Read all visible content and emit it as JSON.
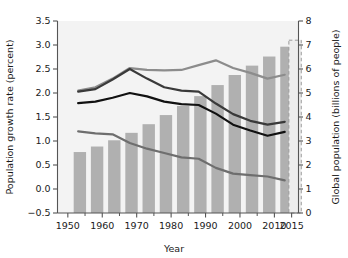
{
  "chart_data": {
    "type": "bar",
    "title": "",
    "xlabel": "Year",
    "ylabel": "Population growth rate (percent)",
    "y2label": "Global population (billions of people)",
    "xlim": [
      1947,
      2017
    ],
    "ylim": [
      -0.5,
      3.5
    ],
    "y2lim": [
      0,
      8
    ],
    "grid": false,
    "legend": "none",
    "xticks": [
      1950,
      1960,
      1970,
      1980,
      1990,
      2000,
      2010,
      2015
    ],
    "xtick_labels": [
      "1950",
      "1960",
      "1970",
      "1980",
      "1990",
      "2000",
      "2010",
      "2015"
    ],
    "xminor_ticks": [
      1955,
      1965,
      1975,
      1985,
      1995,
      2005
    ],
    "yticks": [
      -0.5,
      0.0,
      0.5,
      1.0,
      1.5,
      2.0,
      2.5,
      3.0,
      3.5
    ],
    "ytick_labels": [
      "−0.5",
      "0.0",
      "0.5",
      "1.0",
      "1.5",
      "2.0",
      "2.5",
      "3.0",
      "3.5"
    ],
    "y2ticks": [
      0,
      1,
      2,
      3,
      4,
      5,
      6,
      7,
      8
    ],
    "y2tick_labels": [
      "0",
      "1",
      "2",
      "3",
      "4",
      "5",
      "6",
      "7",
      "8"
    ],
    "bars": {
      "name": "Global population",
      "axis": "right",
      "unit": "billions of people",
      "color": "#b0b0b0",
      "categories": [
        1950,
        1955,
        1960,
        1965,
        1970,
        1975,
        1980,
        1985,
        1990,
        1995,
        2000,
        2005,
        2010
      ],
      "values": [
        2.54,
        2.77,
        3.03,
        3.34,
        3.7,
        4.08,
        4.46,
        4.87,
        5.33,
        5.75,
        6.14,
        6.52,
        6.93
      ]
    },
    "projection_bar": {
      "name": "Projected global population",
      "axis": "right",
      "style": "dashed-outline",
      "color": "#9a9a9a",
      "category": 2015,
      "value": 7.2
    },
    "series": [
      {
        "name": "Less developed regions growth rate",
        "axis": "left",
        "color": "#8c8c8c",
        "x": [
          1953,
          1958,
          1963,
          1968,
          1973,
          1978,
          1983,
          1988,
          1993,
          1998,
          2003,
          2008,
          2013
        ],
        "values": [
          2.05,
          2.12,
          2.3,
          2.52,
          2.48,
          2.47,
          2.48,
          2.58,
          2.68,
          2.52,
          2.42,
          2.3,
          2.38
        ]
      },
      {
        "name": "World growth rate",
        "axis": "left",
        "color": "#3a3a3a",
        "x": [
          1953,
          1958,
          1963,
          1968,
          1973,
          1978,
          1983,
          1988,
          1993,
          1998,
          2003,
          2008,
          2013
        ],
        "values": [
          2.03,
          2.08,
          2.28,
          2.5,
          2.3,
          2.12,
          2.05,
          2.03,
          1.78,
          1.56,
          1.42,
          1.34,
          1.4
        ]
      },
      {
        "name": "More developed regions growth rate",
        "axis": "left",
        "color": "#111111",
        "x": [
          1953,
          1958,
          1963,
          1968,
          1973,
          1978,
          1983,
          1988,
          1993,
          1998,
          2003,
          2008,
          2013
        ],
        "values": [
          1.79,
          1.82,
          1.9,
          2.0,
          1.93,
          1.82,
          1.77,
          1.75,
          1.57,
          1.34,
          1.22,
          1.11,
          1.19
        ]
      },
      {
        "name": "Least developed regions growth rate",
        "axis": "left",
        "color": "#6e6e6e",
        "x": [
          1953,
          1958,
          1963,
          1968,
          1973,
          1978,
          1983,
          1988,
          1993,
          1998,
          2003,
          2008,
          2013
        ],
        "values": [
          1.2,
          1.16,
          1.14,
          0.96,
          0.84,
          0.75,
          0.66,
          0.63,
          0.44,
          0.32,
          0.29,
          0.26,
          0.18
        ]
      }
    ]
  }
}
